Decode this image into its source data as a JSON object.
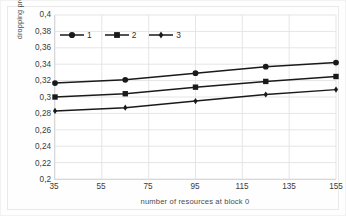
{
  "chart_data": {
    "type": "line",
    "title": "",
    "subtitle": "",
    "xlabel": "number of resources at block 0",
    "ylabel": "dropping probability",
    "x": [
      35,
      65,
      95,
      125,
      155
    ],
    "xlim": [
      35,
      155
    ],
    "ylim": [
      0.2,
      0.4
    ],
    "x_tick_labels": [
      "35",
      "55",
      "75",
      "95",
      "115",
      "135",
      "155"
    ],
    "x_tick_values": [
      35,
      55,
      75,
      95,
      115,
      135,
      155
    ],
    "y_tick_labels": [
      "0,4",
      "0,38",
      "0,36",
      "0,34",
      "0,32",
      "0,3",
      "0,28",
      "0,26",
      "0,24",
      "0,22",
      "0,2"
    ],
    "y_tick_values": [
      0.4,
      0.38,
      0.36,
      0.34,
      0.32,
      0.3,
      0.28,
      0.26,
      0.24,
      0.22,
      0.2
    ],
    "grid": "both",
    "legend_position": "top-left-inside",
    "decimal_separator": ",",
    "series": [
      {
        "name": "1",
        "marker": "circle",
        "color": "#1a1a1a",
        "values": [
          0.317,
          0.321,
          0.329,
          0.337,
          0.342
        ]
      },
      {
        "name": "2",
        "marker": "square",
        "color": "#1a1a1a",
        "values": [
          0.3,
          0.304,
          0.312,
          0.319,
          0.325
        ]
      },
      {
        "name": "3",
        "marker": "diamond",
        "color": "#1a1a1a",
        "values": [
          0.283,
          0.287,
          0.295,
          0.303,
          0.309
        ]
      }
    ],
    "colors": {
      "series_line": "#1a1a1a",
      "gridline": "#e2e2e2",
      "axis": "#d0d0d0",
      "tick_text": "#3b3b3b",
      "plot_background": "#ffffff"
    }
  },
  "legend": {
    "entries": [
      {
        "label": "1"
      },
      {
        "label": "2"
      },
      {
        "label": "3"
      }
    ]
  }
}
